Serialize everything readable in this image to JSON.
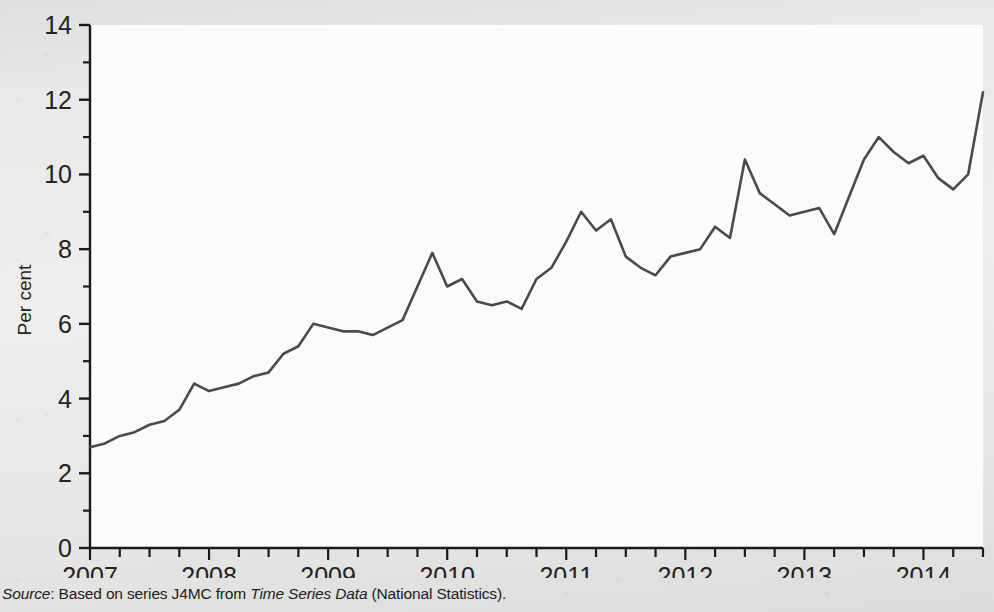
{
  "figure": {
    "background_color": "#e9e9e7",
    "plot_background_color": "#fbfbfa",
    "axis_color": "#1a1a1a",
    "line_color": "#4a4a4a"
  },
  "caption": {
    "source_label": "Source",
    "colon": ": ",
    "text_before_italic": "Based on series J4MC from ",
    "italic_title": "Time Series Data",
    "text_after_italic": " (National Statistics)."
  },
  "chart_data": {
    "type": "line",
    "title": "",
    "xlabel": "",
    "ylabel": "Per cent",
    "ylim": [
      0,
      14
    ],
    "xlim": [
      2007.0,
      2014.5
    ],
    "grid": false,
    "legend": "none",
    "y_ticks_major": [
      0,
      2,
      4,
      6,
      8,
      10,
      12,
      14
    ],
    "y_ticks_minor": [
      1,
      3,
      5,
      7,
      9,
      11,
      13
    ],
    "y_tick_labels": [
      "0",
      "2",
      "4",
      "6",
      "8",
      "10",
      "12",
      "14"
    ],
    "x_tick_labels": [
      "2007",
      "2008",
      "2009",
      "2010",
      "2011",
      "2012",
      "2013",
      "2014"
    ],
    "x_tick_values": [
      2007,
      2008,
      2009,
      2010,
      2011,
      2012,
      2013,
      2014
    ],
    "x_minor_tick_interval": 0.25,
    "series": [
      {
        "name": "Per cent",
        "x": [
          2007.0,
          2007.125,
          2007.25,
          2007.375,
          2007.5,
          2007.625,
          2007.75,
          2007.875,
          2008.0,
          2008.125,
          2008.25,
          2008.375,
          2008.5,
          2008.625,
          2008.75,
          2008.875,
          2009.0,
          2009.125,
          2009.25,
          2009.375,
          2009.5,
          2009.625,
          2009.75,
          2009.875,
          2010.0,
          2010.125,
          2010.25,
          2010.375,
          2010.5,
          2010.625,
          2010.75,
          2010.875,
          2011.0,
          2011.125,
          2011.25,
          2011.375,
          2011.5,
          2011.625,
          2011.75,
          2011.875,
          2012.0,
          2012.125,
          2012.25,
          2012.375,
          2012.5,
          2012.625,
          2012.75,
          2012.875,
          2013.0,
          2013.125,
          2013.25,
          2013.375,
          2013.5,
          2013.625,
          2013.75,
          2013.875,
          2014.0,
          2014.125,
          2014.25,
          2014.375,
          2014.5
        ],
        "values": [
          2.7,
          2.8,
          3.0,
          3.1,
          3.3,
          3.4,
          3.7,
          4.4,
          4.2,
          4.3,
          4.4,
          4.6,
          4.7,
          5.2,
          5.4,
          6.0,
          5.9,
          5.8,
          5.8,
          5.7,
          5.9,
          6.1,
          7.0,
          7.9,
          7.0,
          7.2,
          6.6,
          6.5,
          6.6,
          6.4,
          7.2,
          7.5,
          8.2,
          9.0,
          8.5,
          8.8,
          7.8,
          7.5,
          7.3,
          7.8,
          7.9,
          8.0,
          8.6,
          8.3,
          10.4,
          9.5,
          9.2,
          8.9,
          9.0,
          9.1,
          8.4,
          9.4,
          10.4,
          11.0,
          10.6,
          10.3,
          10.5,
          9.9,
          9.6,
          10.0,
          12.2
        ]
      }
    ],
    "annotations": []
  }
}
